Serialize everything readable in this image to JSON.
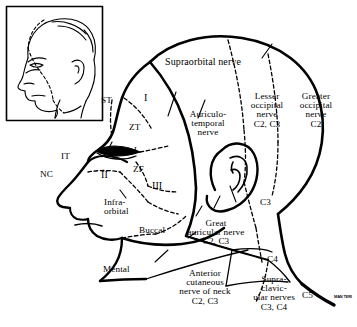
{
  "figure": {
    "kind": "anatomical-line-diagram",
    "ink_color": "#000000",
    "background_color": "#ffffff"
  },
  "inset": {
    "name": "head-profile-inset",
    "description": "Small framed lateral portrait of a head at upper-left"
  },
  "labels": {
    "supraorbital": "Supraorbital nerve",
    "auriculotemporal": "Auriculo-\ntemporal\nnerve",
    "lesser_occipital": "Lesser\noccipital\nnerve\nC2, C3",
    "greater_occipital": "Greater\noccipital\nnerve\nC2",
    "infraorbital": "Infra-\norbital",
    "buccal": "Buccal",
    "mental": "Mental",
    "great_auricular": "Great\nauricular nerve\nC2, C3",
    "anterior_cutaneous": "Anterior\ncutaneous\nnerve of neck\nC2, C3",
    "supraclavicular": "Supra-\nclavic-\nular nerves\nC3, C4"
  },
  "abbreviations": {
    "st": "ST",
    "it": "IT",
    "zt": "ZT",
    "zf": "ZF",
    "nc": "NC",
    "l": "L",
    "div1": "I",
    "div2": "II",
    "div3": "III"
  },
  "dermatomes": {
    "c3_neck": "C3",
    "c4": "C4",
    "c5": "C5"
  },
  "credit": {
    "watermark": "MAN\nTERI"
  }
}
